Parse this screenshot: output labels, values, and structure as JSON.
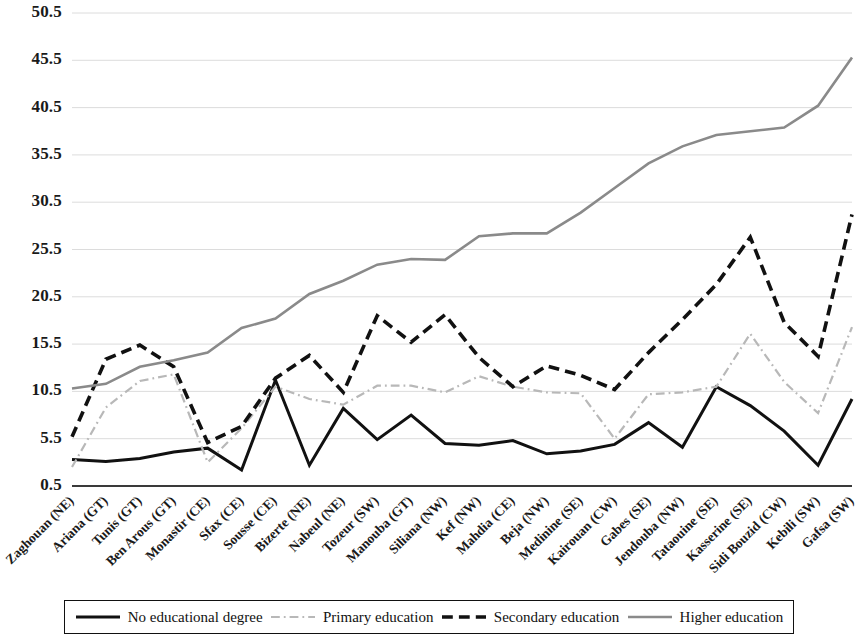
{
  "chart_data": {
    "type": "line",
    "title": "",
    "subtitle": "",
    "xlabel": "",
    "ylabel": "",
    "ylim": [
      0.5,
      50.5
    ],
    "grid": true,
    "legend_position": "bottom",
    "ytick_labels": [
      "50.5",
      "45.5",
      "40.5",
      "35.5",
      "30.5",
      "25.5",
      "20.5",
      "15.5",
      "10.5",
      "5.5",
      "0.5"
    ],
    "ytick_values": [
      50.5,
      45.5,
      40.5,
      35.5,
      30.5,
      25.5,
      20.5,
      15.5,
      10.5,
      5.5,
      0.5
    ],
    "categories": [
      "Zaghouan (NE)",
      "Ariana (GT)",
      "Tunis (GT)",
      "Ben Arous (GT)",
      "Monastir (CE)",
      "Sfax (CE)",
      "Sousse (CE)",
      "Bizerte (NE)",
      "Nabeul (NE)",
      "Tozeur (SW)",
      "Manouba (GT)",
      "Siliana (NW)",
      "Kef (NW)",
      "Mahdia (CE)",
      "Beja (NW)",
      "Medinine (SE)",
      "Kairouan (CW)",
      "Gabes (SE)",
      "Jendouba (NW)",
      "Tataouine (SE)",
      "Kasserine (SE)",
      "Sidi Bouzid (CW)",
      "Kebili (SW)",
      "Gafsa (SW)"
    ],
    "series": [
      {
        "name": "No educational degree",
        "style": "solid",
        "color": "#111111",
        "width": 3.0,
        "values": [
          3.3,
          3.1,
          3.4,
          4.1,
          4.5,
          2.2,
          11.7,
          2.7,
          8.7,
          5.4,
          8.0,
          5.0,
          4.8,
          5.3,
          3.9,
          4.2,
          4.9,
          7.2,
          4.6,
          11.0,
          9.0,
          6.3,
          2.7,
          9.7
        ]
      },
      {
        "name": "Primary education",
        "style": "dashdot",
        "color": "#b8b8b8",
        "width": 2.2,
        "values": [
          2.5,
          8.8,
          11.6,
          12.3,
          3.0,
          6.6,
          11.0,
          9.7,
          9.1,
          11.1,
          11.1,
          10.4,
          12.1,
          11.0,
          10.4,
          10.3,
          5.5,
          10.2,
          10.4,
          11.0,
          16.6,
          11.5,
          8.2,
          17.3
        ]
      },
      {
        "name": "Secondary education",
        "style": "dashed",
        "color": "#111111",
        "width": 3.6,
        "values": [
          5.7,
          13.9,
          15.4,
          13.1,
          5.1,
          6.8,
          11.9,
          14.3,
          10.4,
          18.5,
          15.7,
          18.6,
          14.1,
          11.0,
          13.2,
          12.2,
          10.7,
          14.6,
          18.1,
          21.8,
          26.8,
          17.8,
          14.2,
          29.2
        ]
      },
      {
        "name": "Higher education",
        "style": "solid",
        "color": "#8a8a8a",
        "width": 2.6,
        "values": [
          10.8,
          11.3,
          13.1,
          13.8,
          14.6,
          17.2,
          18.2,
          20.8,
          22.2,
          23.9,
          24.5,
          24.4,
          26.9,
          27.2,
          27.2,
          29.4,
          32.0,
          34.6,
          36.4,
          37.6,
          38.0,
          38.4,
          40.7,
          45.8
        ]
      }
    ]
  },
  "legend": {
    "items": [
      {
        "label": "No educational degree",
        "swatch": "solid-black-line"
      },
      {
        "label": "Primary education",
        "swatch": "dashdot-gray-line"
      },
      {
        "label": "Secondary education",
        "swatch": "dashed-black-line"
      },
      {
        "label": "Higher education",
        "swatch": "solid-gray-line"
      }
    ]
  }
}
